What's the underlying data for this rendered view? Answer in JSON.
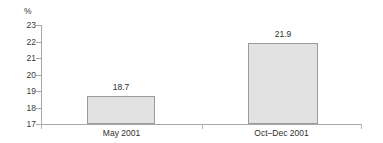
{
  "chart_data": {
    "type": "bar",
    "title": "",
    "subtitle": "",
    "xlabel": "",
    "ylabel": "%",
    "unit_label": "%",
    "categories": [
      "May 2001",
      "Oct–Dec 2001"
    ],
    "values": [
      18.7,
      21.9
    ],
    "value_labels": [
      "18.7",
      "21.9"
    ],
    "ylim": [
      17,
      23
    ],
    "yticks": [
      23,
      22,
      21,
      20,
      19,
      18,
      17
    ],
    "ytick_labels": [
      "23",
      "22",
      "21",
      "20",
      "19",
      "18",
      "17"
    ],
    "grid": false,
    "legend": false,
    "legend_position": "none",
    "series": [
      {
        "name": "",
        "values": [
          18.7,
          21.9
        ]
      }
    ],
    "colors": {
      "bar_fill": "#e2e2e2",
      "bar_stroke": "#9b9b9b",
      "axis": "#a8a8a8",
      "text": "#2f2f2f",
      "background": "#ffffff"
    }
  }
}
